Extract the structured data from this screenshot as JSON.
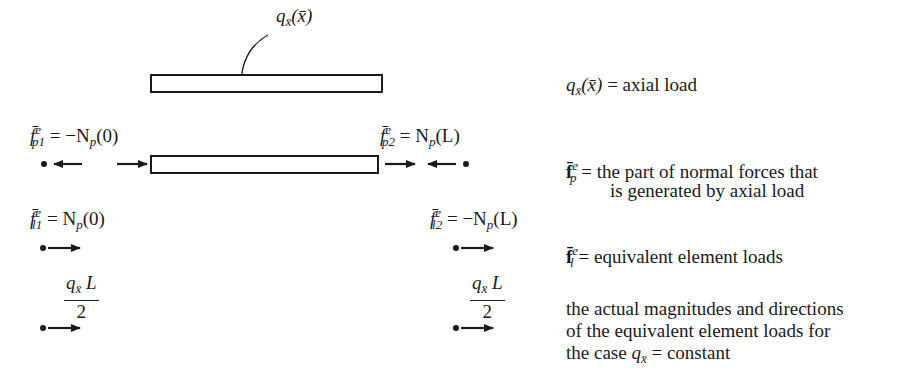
{
  "diagram": {
    "load_label": {
      "symbol": "q",
      "sub": "x̄",
      "arg": "(x̄)"
    },
    "rows": {
      "p_left": {
        "lhs": "f̄",
        "sup": "e",
        "sub": "p1",
        "rhs": "= −N",
        "rhs_sub": "p",
        "rhs_arg": "(0)"
      },
      "p_right": {
        "lhs": "f̄",
        "sup": "e",
        "sub": "p2",
        "rhs": "= N",
        "rhs_sub": "p",
        "rhs_arg": "(L)"
      },
      "l_left": {
        "lhs": "f̄",
        "sup": "e",
        "sub": "l1",
        "rhs": "= N",
        "rhs_sub": "p",
        "rhs_arg": "(0)"
      },
      "l_right": {
        "lhs": "f̄",
        "sup": "e",
        "sub": "l2",
        "rhs": "= −N",
        "rhs_sub": "p",
        "rhs_arg": "(L)"
      },
      "q_left": {
        "num_q": "q",
        "num_sub": "x̄",
        "num_L": "L",
        "den": "2"
      },
      "q_right": {
        "num_q": "q",
        "num_sub": "x̄",
        "num_L": "L",
        "den": "2"
      }
    },
    "num_distributed_arrows": 7
  },
  "legend": {
    "axial": {
      "symbol": "q",
      "sub": "x̄",
      "arg": "(x̄)",
      "text": "= axial load"
    },
    "fp": {
      "symbol": "f̄",
      "sup": "e",
      "sub": "p",
      "text_line1": "= the part of normal forces that",
      "text_line2": "is generated by axial load"
    },
    "fl": {
      "symbol": "f̄",
      "sup": "e",
      "sub": "l",
      "text": "= equivalent element loads"
    },
    "note": {
      "line1": "the actual magnitudes and directions",
      "line2": "of the equivalent element loads for",
      "line3_prefix": "the case",
      "line3_symbol": "q",
      "line3_sub": "x̄",
      "line3_suffix": "= constant"
    }
  },
  "colors": {
    "ink": "#1a1a1a",
    "background": "#ffffff"
  }
}
